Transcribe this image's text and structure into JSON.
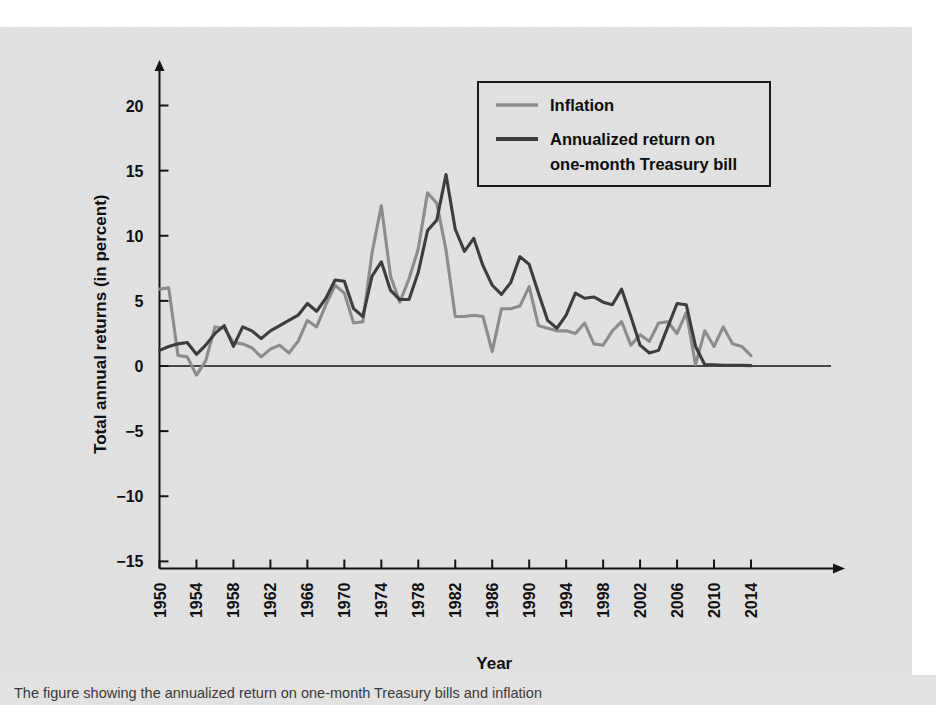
{
  "figure": {
    "background_color": "#e2e2e2",
    "page_color": "#ffffff",
    "caption": "The figure showing the annualized return on one-month Treasury bills and inflation"
  },
  "legend": {
    "position": "top-right",
    "border_color": "#1a1a1a",
    "items": [
      {
        "label": "Inflation",
        "color": "#8c8c8c",
        "key": "inflation"
      },
      {
        "label": "Annualized return on",
        "label2": "one-month Treasury bill",
        "color": "#3d3d3d",
        "key": "tbill"
      }
    ]
  },
  "axes": {
    "x": {
      "label": "Year",
      "ticks": [
        1950,
        1954,
        1958,
        1962,
        1966,
        1970,
        1974,
        1978,
        1982,
        1986,
        1990,
        1994,
        1998,
        2002,
        2006,
        2010,
        2014
      ],
      "tick_rotation_deg": -90,
      "range": [
        1950,
        2015
      ],
      "has_arrow": true
    },
    "y": {
      "label": "Total annual returns (in percent)",
      "ticks": [
        -15,
        -10,
        -5,
        0,
        5,
        10,
        15,
        20
      ],
      "tick_labels": [
        "−15",
        "−10",
        "−5",
        "0",
        "5",
        "10",
        "15",
        "20"
      ],
      "range": [
        -15,
        22.5
      ],
      "has_arrow": true,
      "zero_line": true
    },
    "grid": false
  },
  "chart_data": {
    "type": "line",
    "title": "",
    "subtitle": "",
    "xlabel": "Year",
    "ylabel": "Total annual returns (in percent)",
    "xlim": [
      1950,
      2015
    ],
    "ylim": [
      -15,
      22.5
    ],
    "grid": false,
    "legend_position": "top-right",
    "x": [
      1950,
      1951,
      1952,
      1953,
      1954,
      1955,
      1956,
      1957,
      1958,
      1959,
      1960,
      1961,
      1962,
      1963,
      1964,
      1965,
      1966,
      1967,
      1968,
      1969,
      1970,
      1971,
      1972,
      1973,
      1974,
      1975,
      1976,
      1977,
      1978,
      1979,
      1980,
      1981,
      1982,
      1983,
      1984,
      1985,
      1986,
      1987,
      1988,
      1989,
      1990,
      1991,
      1992,
      1993,
      1994,
      1995,
      1996,
      1997,
      1998,
      1999,
      2000,
      2001,
      2002,
      2003,
      2004,
      2005,
      2006,
      2007,
      2008,
      2009,
      2010,
      2011,
      2012,
      2013,
      2014
    ],
    "series": [
      {
        "name": "Inflation",
        "color": "#8c8c8c",
        "values": [
          5.9,
          6.0,
          0.8,
          0.7,
          -0.7,
          0.4,
          3.0,
          2.9,
          1.8,
          1.7,
          1.4,
          0.7,
          1.3,
          1.6,
          1.0,
          1.9,
          3.5,
          3.0,
          4.7,
          6.2,
          5.6,
          3.3,
          3.4,
          8.7,
          12.3,
          6.9,
          4.9,
          6.7,
          9.0,
          13.3,
          12.5,
          8.9,
          3.8,
          3.8,
          3.9,
          3.8,
          1.1,
          4.4,
          4.4,
          4.6,
          6.1,
          3.1,
          2.9,
          2.7,
          2.7,
          2.5,
          3.3,
          1.7,
          1.6,
          2.7,
          3.4,
          1.6,
          2.4,
          1.9,
          3.3,
          3.4,
          2.5,
          4.1,
          0.1,
          2.7,
          1.5,
          3.0,
          1.7,
          1.5,
          0.8
        ],
        "peak_year": 1979,
        "peak_value": 13.3,
        "min_year": 1954,
        "min_value": -0.7
      },
      {
        "name": "Annualized return on one-month Treasury bill",
        "color": "#3d3d3d",
        "values": [
          1.2,
          1.5,
          1.7,
          1.8,
          0.9,
          1.6,
          2.5,
          3.1,
          1.5,
          3.0,
          2.7,
          2.1,
          2.7,
          3.1,
          3.5,
          3.9,
          4.8,
          4.2,
          5.2,
          6.6,
          6.5,
          4.4,
          3.8,
          6.9,
          8.0,
          5.8,
          5.1,
          5.1,
          7.2,
          10.4,
          11.2,
          14.7,
          10.5,
          8.8,
          9.8,
          7.7,
          6.2,
          5.5,
          6.4,
          8.4,
          7.8,
          5.6,
          3.5,
          2.9,
          3.9,
          5.6,
          5.2,
          5.3,
          4.9,
          4.7,
          5.9,
          3.8,
          1.6,
          1.0,
          1.2,
          3.0,
          4.8,
          4.7,
          1.5,
          0.1,
          0.1,
          0.05,
          0.05,
          0.05,
          0.03
        ],
        "peak_year": 1981,
        "peak_value": 14.7,
        "min_year": 2014,
        "min_value": 0.03
      }
    ]
  }
}
